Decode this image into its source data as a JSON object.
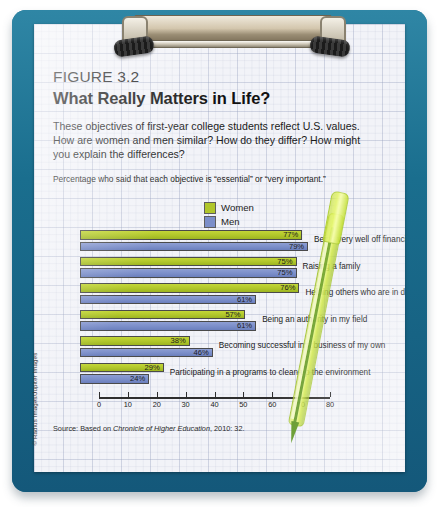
{
  "figure": {
    "number": "FIGURE 3.2",
    "title": "What Really Matters in Life?",
    "intro": "These objectives of first-year college students reflect U.S. values. How are women and men similar? How do they differ? How might you explain the differences?",
    "subtitle": "Percentage who said that each objective is “essential” or “very important.”",
    "source_prefix": "Source: Based on ",
    "source_italic": "Chronicle of Higher Education",
    "source_suffix": ", 2010: 32.",
    "credit": "© Radius Images/Jupiter Images"
  },
  "colors": {
    "women": "#b0c62a",
    "men": "#7b8ec9",
    "clipboard": "#1a6e8e",
    "paper": "#f2f3f8",
    "pen": "#cde23c"
  },
  "chart_data": {
    "type": "bar",
    "orientation": "horizontal",
    "title": "What Really Matters in Life?",
    "subtitle": "Percentage who said that each objective is “essential” or “very important.”",
    "xlabel": "",
    "ylabel": "",
    "xlim": [
      0,
      80
    ],
    "xticks": [
      0,
      10,
      20,
      30,
      40,
      50,
      60,
      70,
      80
    ],
    "grid": false,
    "legend_position": "top-center",
    "categories": [
      "Being very well off financially",
      "Raising a family",
      "Helping others who are in difficulty",
      "Being an authority in my field",
      "Becoming successful in a business of my own",
      "Participating in a programs to clean up the environment"
    ],
    "series": [
      {
        "name": "Women",
        "color": "#b0c62a",
        "values": [
          77,
          75,
          76,
          57,
          38,
          29
        ],
        "labels": [
          "77%",
          "75%",
          "76%",
          "57%",
          "38%",
          "29%"
        ]
      },
      {
        "name": "Men",
        "color": "#7b8ec9",
        "values": [
          79,
          75,
          61,
          61,
          46,
          24
        ],
        "labels": [
          "79%",
          "75%",
          "61%",
          "61%",
          "46%",
          "24%"
        ]
      }
    ]
  }
}
